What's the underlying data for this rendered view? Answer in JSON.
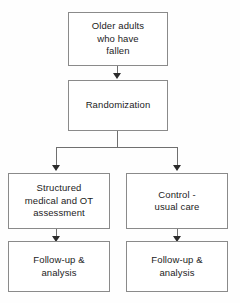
{
  "diagram": {
    "type": "flowchart",
    "colors": {
      "box_border": "#8a8a8a",
      "box_fill": "#ffffff",
      "connector": "#6f6f6f",
      "arrow_head": "#2b2b2b",
      "text": "#1c1c1c",
      "background": "#fefefe"
    },
    "nodes": [
      {
        "id": "population",
        "label": "Older adults\nwho have\nfallen"
      },
      {
        "id": "randomization",
        "label": "Randomization"
      },
      {
        "id": "intervention",
        "label": "Structured\nmedical and OT\nassessment"
      },
      {
        "id": "control",
        "label": "Control -\nusual care"
      },
      {
        "id": "followup_left",
        "label": "Follow-up &\nanalysis"
      },
      {
        "id": "followup_right",
        "label": "Follow-up &\nanalysis"
      }
    ],
    "edges": [
      {
        "from": "population",
        "to": "randomization",
        "style": "arrow-down"
      },
      {
        "from": "randomization",
        "to": "intervention",
        "style": "fork-left"
      },
      {
        "from": "randomization",
        "to": "control",
        "style": "fork-right"
      },
      {
        "from": "intervention",
        "to": "followup_left",
        "style": "arrow-down"
      },
      {
        "from": "control",
        "to": "followup_right",
        "style": "arrow-down"
      }
    ]
  }
}
